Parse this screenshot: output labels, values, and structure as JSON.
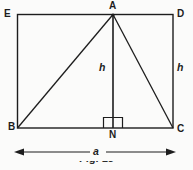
{
  "figure": {
    "caption": "Fig. 13",
    "background_color": "#fbfbfa",
    "stroke_color": "#1d1d1d",
    "labels": {
      "vertex_e": "E",
      "vertex_d": "D",
      "vertex_a": "A",
      "vertex_b": "B",
      "vertex_c": "C",
      "foot_n": "N",
      "height_inner": "h",
      "height_right": "h",
      "base_dimension": "a"
    }
  },
  "geometry": {
    "rectangle": {
      "name": "EBCD",
      "left": 17,
      "top": 14,
      "right": 173,
      "bottom": 128,
      "width": 156,
      "height": 114
    },
    "triangle": {
      "name": "ABC",
      "apex": {
        "x": 113,
        "y": 14
      },
      "base_left": {
        "x": 17,
        "y": 128
      },
      "base_right": {
        "x": 173,
        "y": 128
      }
    },
    "altitude": {
      "from": {
        "x": 113,
        "y": 14
      },
      "to": {
        "x": 113,
        "y": 128
      },
      "label": "h",
      "right_angle_marker": {
        "x": 103,
        "y": 117,
        "width": 20,
        "height": 11
      }
    },
    "dimension_line": {
      "y": 152,
      "x_start": 15,
      "x_end": 176,
      "label": "a"
    }
  }
}
